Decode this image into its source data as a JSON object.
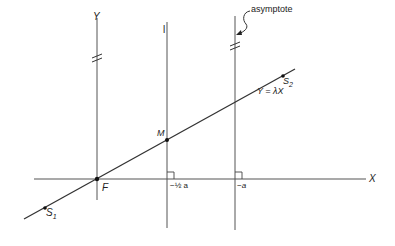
{
  "labels": {
    "y_axis": "Y",
    "x_axis": "X",
    "line_l": "l",
    "asymptote": "asymptote",
    "line_eq": "Y = λX",
    "point_M": "M",
    "point_F": "F",
    "s1_main": "S",
    "s1_sub": "1",
    "s2_main": "S",
    "s2_sub": "2",
    "tick_half_a": "−½ a",
    "tick_a": "−a"
  },
  "colors": {
    "stroke": "#333333",
    "text": "#222222",
    "background": "#ffffff"
  }
}
